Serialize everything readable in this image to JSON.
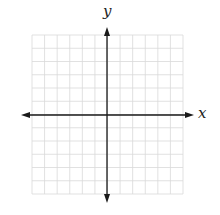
{
  "diagram": {
    "type": "coordinate-plane",
    "grid": {
      "columns": 12,
      "rows": 12,
      "left": 32,
      "top": 35,
      "right": 183,
      "bottom": 194,
      "line_color": "#d9d9d9"
    },
    "axes": {
      "color": "#1a1a1a",
      "x_axis": {
        "y": 115,
        "x_start": 21,
        "x_end": 194,
        "label": "x",
        "arrows": "both"
      },
      "y_axis": {
        "x": 107,
        "y_start": 27,
        "y_end": 203,
        "label": "y",
        "arrows": "both"
      }
    }
  }
}
